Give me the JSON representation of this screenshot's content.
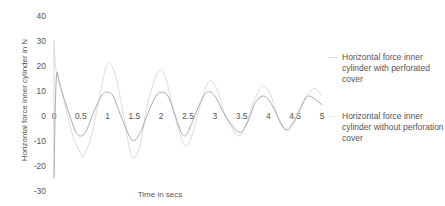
{
  "chart_data": {
    "type": "line",
    "title": "",
    "xlabel": "Time in secs",
    "ylabel": "Horizontal force inner cylinder in N",
    "xlim": [
      0,
      5
    ],
    "ylim": [
      -30,
      40
    ],
    "x_ticks": [
      "0",
      "0.5",
      "1",
      "1.5",
      "2",
      "2.5",
      "3",
      "3.5",
      "4",
      "4.5",
      "5"
    ],
    "y_ticks": [
      "40",
      "30",
      "20",
      "10",
      "0",
      "-10",
      "-20",
      "-30"
    ],
    "grid": false,
    "legend_position": "right",
    "series": [
      {
        "name": "Horizontal force inner cylinder with perforated cover",
        "color": "#dcdcdc",
        "x": [
          0,
          0.02,
          0.05,
          0.1,
          0.2,
          0.35,
          0.5,
          0.55,
          0.7,
          0.85,
          1.0,
          1.15,
          1.3,
          1.45,
          1.6,
          1.75,
          1.95,
          2.1,
          2.25,
          2.45,
          2.6,
          2.75,
          2.9,
          3.05,
          3.2,
          3.45,
          3.6,
          3.75,
          3.9,
          4.05,
          4.2,
          4.35,
          4.5,
          4.65,
          4.85,
          5.0
        ],
        "values": [
          28,
          22,
          17,
          14,
          5,
          -8,
          -15,
          -16,
          -8,
          8,
          21,
          16,
          0,
          -16,
          -12,
          5,
          18,
          14,
          0,
          -12,
          -6,
          6,
          14,
          10,
          0,
          -8,
          -2,
          7,
          12,
          8,
          -2,
          -6,
          -2,
          6,
          11,
          8
        ]
      },
      {
        "name": "Horizontal force inner cylinder without perforation cover",
        "color": "#aaaaaa",
        "x": [
          0,
          0.02,
          0.05,
          0.1,
          0.15,
          0.25,
          0.4,
          0.5,
          0.6,
          0.75,
          0.9,
          1.0,
          1.1,
          1.25,
          1.45,
          1.6,
          1.75,
          1.9,
          2.0,
          2.15,
          2.4,
          2.55,
          2.7,
          2.85,
          3.0,
          3.2,
          3.45,
          3.6,
          3.75,
          3.9,
          4.05,
          4.3,
          4.45,
          4.6,
          4.75,
          5.0
        ],
        "values": [
          -25,
          0,
          17,
          13,
          9.5,
          3,
          -6,
          -8,
          -6,
          2,
          8.5,
          9.5,
          8,
          0,
          -9.5,
          -7,
          1,
          8,
          9.5,
          7,
          -7.5,
          -4,
          4,
          9.5,
          8,
          0,
          -6.5,
          -3,
          5,
          8,
          5,
          -5,
          -3,
          3,
          8,
          4.5
        ]
      }
    ]
  },
  "legend": [
    {
      "label": "Horizontal force inner cylinder with perforated cover"
    },
    {
      "label": "Horizontal force inner cylinder without perforation cover"
    }
  ]
}
